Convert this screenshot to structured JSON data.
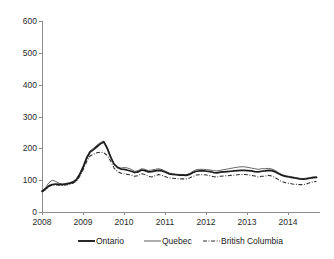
{
  "chart_data": {
    "type": "line",
    "title": "",
    "subtitle": "",
    "xlabel": "",
    "ylabel": "",
    "xlim": [
      2008,
      2014.75
    ],
    "ylim": [
      0,
      600
    ],
    "grid": false,
    "legend_position": "bottom",
    "y_ticks": [
      "0",
      "100",
      "200",
      "300",
      "400",
      "500",
      "600"
    ],
    "y_tick_values": [
      0,
      100,
      200,
      300,
      400,
      500,
      600
    ],
    "x_ticks": [
      "2008",
      "2009",
      "2010",
      "2011",
      "2012",
      "2013",
      "2014"
    ],
    "x_tick_values": [
      2008,
      2009,
      2010,
      2011,
      2012,
      2013,
      2014
    ],
    "x": [
      2008.0,
      2008.083,
      2008.167,
      2008.25,
      2008.333,
      2008.417,
      2008.5,
      2008.583,
      2008.667,
      2008.75,
      2008.833,
      2008.917,
      2009.0,
      2009.083,
      2009.167,
      2009.25,
      2009.333,
      2009.417,
      2009.5,
      2009.583,
      2009.667,
      2009.75,
      2009.833,
      2009.917,
      2010.0,
      2010.083,
      2010.167,
      2010.25,
      2010.333,
      2010.417,
      2010.5,
      2010.583,
      2010.667,
      2010.75,
      2010.833,
      2010.917,
      2011.0,
      2011.083,
      2011.167,
      2011.25,
      2011.333,
      2011.417,
      2011.5,
      2011.583,
      2011.667,
      2011.75,
      2011.833,
      2011.917,
      2012.0,
      2012.083,
      2012.167,
      2012.25,
      2012.333,
      2012.417,
      2012.5,
      2012.583,
      2012.667,
      2012.75,
      2012.833,
      2012.917,
      2013.0,
      2013.083,
      2013.167,
      2013.25,
      2013.333,
      2013.417,
      2013.5,
      2013.583,
      2013.667,
      2013.75,
      2013.833,
      2013.917,
      2014.0,
      2014.083,
      2014.167,
      2014.25,
      2014.333,
      2014.417,
      2014.5,
      2014.583,
      2014.667
    ],
    "series": [
      {
        "name": "Ontario",
        "style": "solid-thick",
        "color": "#1c1c1c",
        "values": [
          65,
          72,
          82,
          86,
          88,
          87,
          86,
          88,
          90,
          93,
          100,
          118,
          140,
          168,
          188,
          196,
          205,
          214,
          220,
          200,
          172,
          150,
          140,
          135,
          134,
          131,
          128,
          124,
          126,
          132,
          130,
          126,
          127,
          129,
          131,
          129,
          125,
          120,
          118,
          117,
          116,
          116,
          115,
          118,
          124,
          128,
          129,
          129,
          128,
          127,
          124,
          123,
          125,
          126,
          127,
          128,
          129,
          130,
          131,
          131,
          130,
          129,
          127,
          126,
          128,
          129,
          131,
          130,
          126,
          120,
          115,
          112,
          110,
          108,
          106,
          104,
          103,
          104,
          106,
          108,
          109
        ]
      },
      {
        "name": "Quebec",
        "style": "solid-thin",
        "color": "#4a4a4a",
        "values": [
          66,
          76,
          92,
          100,
          96,
          90,
          88,
          90,
          92,
          96,
          104,
          122,
          146,
          174,
          192,
          200,
          210,
          218,
          223,
          204,
          176,
          152,
          142,
          138,
          140,
          138,
          134,
          128,
          130,
          136,
          134,
          130,
          132,
          134,
          136,
          133,
          128,
          123,
          120,
          119,
          118,
          118,
          117,
          121,
          128,
          133,
          134,
          134,
          133,
          132,
          130,
          129,
          131,
          133,
          135,
          137,
          139,
          141,
          142,
          142,
          140,
          138,
          136,
          134,
          136,
          136,
          137,
          135,
          130,
          123,
          117,
          114,
          112,
          110,
          108,
          106,
          105,
          106,
          108,
          110,
          110
        ]
      },
      {
        "name": "British Columbia",
        "style": "dash-dot",
        "color": "#2e2e2e",
        "values": [
          63,
          70,
          80,
          84,
          85,
          84,
          83,
          85,
          87,
          90,
          97,
          112,
          133,
          158,
          176,
          182,
          186,
          188,
          186,
          178,
          160,
          138,
          127,
          122,
          120,
          118,
          116,
          112,
          114,
          120,
          118,
          112,
          110,
          114,
          118,
          115,
          111,
          107,
          106,
          105,
          104,
          104,
          104,
          107,
          112,
          116,
          117,
          117,
          116,
          114,
          111,
          110,
          112,
          113,
          114,
          115,
          116,
          117,
          118,
          118,
          117,
          115,
          113,
          110,
          112,
          113,
          115,
          113,
          108,
          101,
          95,
          92,
          90,
          88,
          87,
          86,
          86,
          88,
          92,
          95,
          96
        ]
      }
    ],
    "legend": [
      {
        "label": "Ontario",
        "style": "solid-thick"
      },
      {
        "label": "Quebec",
        "style": "solid-thin"
      },
      {
        "label": "British Columbia",
        "style": "dash-dot"
      }
    ]
  }
}
